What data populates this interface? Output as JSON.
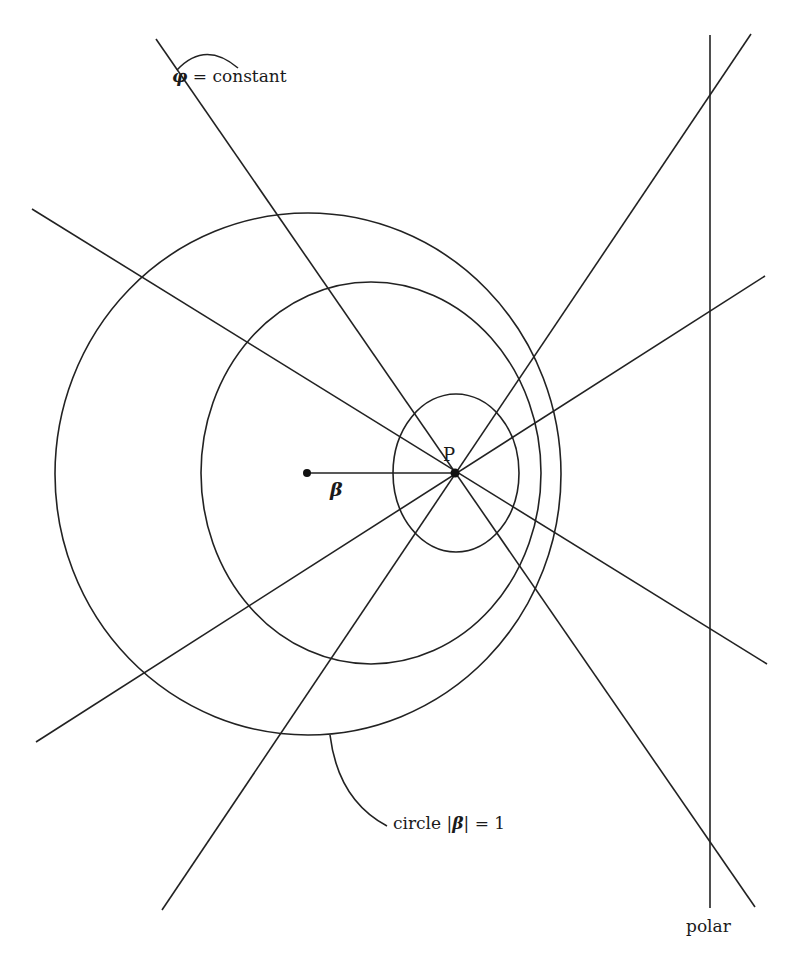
{
  "figure": {
    "labels": {
      "phi_symbol": "φ",
      "phi_rest": " = constant",
      "circle_prefix": "circle |",
      "circle_symbol": "β",
      "circle_suffix": "| = 1",
      "polar": "polar",
      "point": "P",
      "beta": "β"
    },
    "colors": {
      "stroke": "#222222",
      "background": "#ffffff"
    },
    "geometry": {
      "point_P": [
        455,
        473
      ],
      "origin_point": [
        307,
        473
      ],
      "circles": [
        {
          "name": "outer-circle",
          "cx": 308,
          "cy": 474,
          "rx": 253,
          "ry": 261
        },
        {
          "name": "middle-circle",
          "cx": 371,
          "cy": 473,
          "rx": 170,
          "ry": 191
        },
        {
          "name": "inner-circle",
          "cx": 456,
          "cy": 473,
          "rx": 63,
          "ry": 79
        }
      ],
      "lines": [
        {
          "name": "phi-line-steep-a",
          "from": [
            156,
            39
          ],
          "to": [
            755,
            907
          ]
        },
        {
          "name": "phi-line-shallow-a",
          "from": [
            32,
            209
          ],
          "to": [
            767,
            664
          ]
        },
        {
          "name": "phi-line-shallow-b",
          "from": [
            36,
            742
          ],
          "to": [
            765,
            276
          ]
        },
        {
          "name": "phi-line-steep-b",
          "from": [
            162,
            910
          ],
          "to": [
            751,
            34
          ]
        }
      ],
      "polar_line": {
        "x": 710,
        "y1": 35,
        "y2": 908
      }
    }
  }
}
